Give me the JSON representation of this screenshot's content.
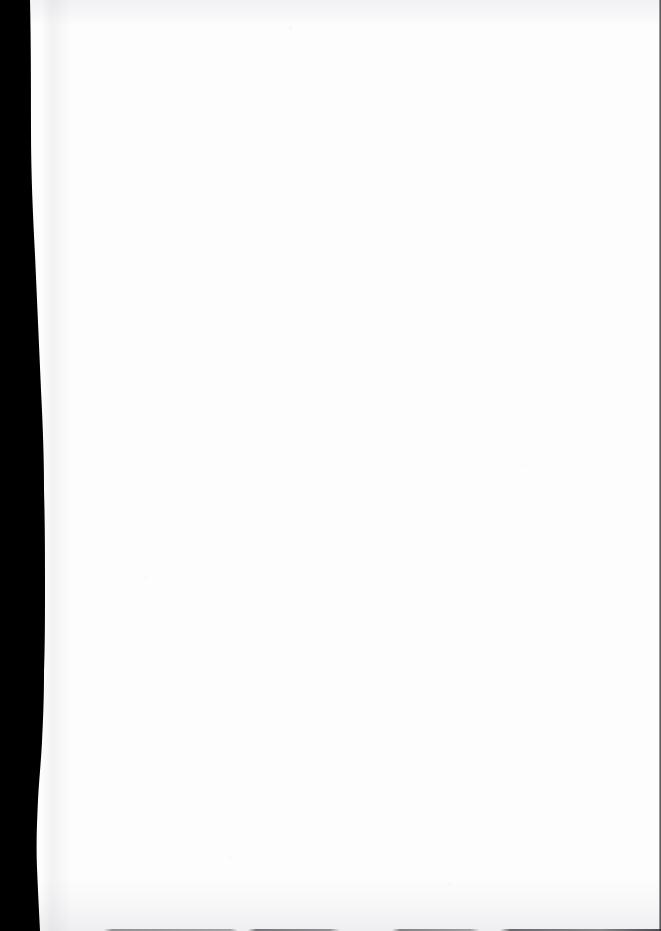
{
  "document": {
    "kind": "scanned-page",
    "page_content": "",
    "page_note": "blank page",
    "width_px": 661,
    "height_px": 931
  },
  "artifacts": {
    "gutter_shadow": {
      "name": "binding-gutter-shadow",
      "position": "left",
      "color": "#000000",
      "top_width_px": 30,
      "max_width_px": 46,
      "bottom_width_px": 38
    },
    "edge_rule_right": {
      "name": "right-edge-rule",
      "color": "#1a1a1e",
      "thickness_px": 2
    },
    "edge_rule_bottom": {
      "name": "bottom-edge-rule",
      "color": "#3c3c42",
      "thickness_px": 2
    },
    "top_smudge": {
      "name": "top-margin-smudge",
      "color": "#8c8c96"
    },
    "bottom_smudge": {
      "name": "bottom-margin-smudge",
      "color": "#8c8c96"
    },
    "paper": {
      "name": "paper-sheet",
      "color": "#fdfdfe"
    }
  }
}
